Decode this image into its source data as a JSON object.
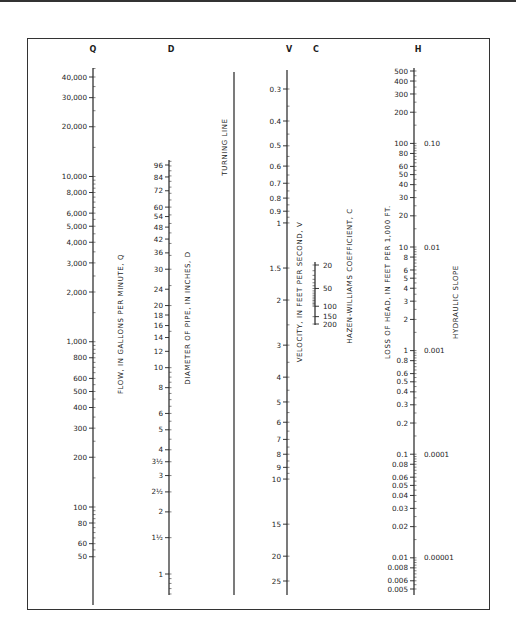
{
  "chart_data": {
    "type": "nomograph",
    "title": "",
    "columns": [
      {
        "key": "Q",
        "header": "Q",
        "title": "FLOW, IN GALLONS PER MINUTE, Q",
        "scale": "log",
        "range": [
          40,
          50000
        ],
        "labels": [
          "40,000",
          "30,000",
          "20,000",
          "10,000",
          "8,000",
          "6,000",
          "5,000",
          "4,000",
          "3,000",
          "2,000",
          "1,000",
          "800",
          "600",
          "500",
          "400",
          "300",
          "200",
          "100",
          "80",
          "60",
          "50"
        ],
        "values": [
          40000,
          30000,
          20000,
          10000,
          8000,
          6000,
          5000,
          4000,
          3000,
          2000,
          1000,
          800,
          600,
          500,
          400,
          300,
          200,
          100,
          80,
          60,
          50
        ]
      },
      {
        "key": "D",
        "header": "D",
        "title": "DIAMETER OF PIPE, IN INCHES, D",
        "scale": "log",
        "range": [
          0.8,
          100
        ],
        "labels": [
          "96",
          "84",
          "72",
          "60",
          "54",
          "48",
          "42",
          "36",
          "30",
          "24",
          "20",
          "18",
          "16",
          "14",
          "12",
          "10",
          "8",
          "6",
          "5",
          "4",
          "3½",
          "3",
          "2½",
          "2",
          "1½",
          "1"
        ],
        "values": [
          96,
          84,
          72,
          60,
          54,
          48,
          42,
          36,
          30,
          24,
          20,
          18,
          16,
          14,
          12,
          10,
          8,
          6,
          5,
          4,
          3.5,
          3,
          2.5,
          2,
          1.5,
          1
        ]
      },
      {
        "key": "T",
        "header": "",
        "title": "TURNING LINE",
        "scale": "none"
      },
      {
        "key": "V",
        "header": "V",
        "title": "VELOCITY, IN FEET PER SECOND, V",
        "scale": "log",
        "range": [
          0.25,
          27
        ],
        "labels": [
          "0.3",
          "0.4",
          "0.5",
          "0.6",
          "0.7",
          "0.8",
          "0.9",
          "1",
          "1.5",
          "2",
          "3",
          "4",
          "5",
          "6",
          "7",
          "8",
          "9",
          "10",
          "15",
          "20",
          "25"
        ],
        "values": [
          0.3,
          0.4,
          0.5,
          0.6,
          0.7,
          0.8,
          0.9,
          1,
          1.5,
          2,
          3,
          4,
          5,
          6,
          7,
          8,
          9,
          10,
          15,
          20,
          25
        ]
      },
      {
        "key": "C",
        "header": "C",
        "title": "HAZEN-WILLIAMS COEFFICIENT, C",
        "scale": "log",
        "range": [
          20,
          200
        ],
        "labels": [
          "20",
          "50",
          "100",
          "150",
          "200"
        ],
        "values": [
          20,
          50,
          100,
          150,
          200
        ]
      },
      {
        "key": "H",
        "header": "H",
        "title": "LOSS OF HEAD, IN FEET PER 1,000 FT.",
        "scale": "log",
        "range": [
          0.005,
          500
        ],
        "labels": [
          "500",
          "400",
          "300",
          "200",
          "100",
          "80",
          "60",
          "50",
          "40",
          "30",
          "20",
          "10",
          "8",
          "6",
          "5",
          "4",
          "3",
          "2",
          "1",
          "0.8",
          "0.6",
          "0.5",
          "0.4",
          "0.3",
          "0.2",
          "0.1",
          "0.08",
          "0.06",
          "0.05",
          "0.04",
          "0.03",
          "0.02",
          "0.01",
          "0.008",
          "0.006",
          "0.005"
        ],
        "values": [
          500,
          400,
          300,
          200,
          100,
          80,
          60,
          50,
          40,
          30,
          20,
          10,
          8,
          6,
          5,
          4,
          3,
          2,
          1,
          0.8,
          0.6,
          0.5,
          0.4,
          0.3,
          0.2,
          0.1,
          0.08,
          0.06,
          0.05,
          0.04,
          0.03,
          0.02,
          0.01,
          0.008,
          0.006,
          0.005
        ]
      },
      {
        "key": "S",
        "header": "",
        "title": "HYDRAULIC SLOPE",
        "scale": "log",
        "labels": [
          "0.10",
          "0.01",
          "0.001",
          "0.0001",
          "0.00001"
        ],
        "values": [
          0.1,
          0.01,
          0.001,
          0.0001,
          1e-05
        ]
      }
    ],
    "grid": false,
    "legend": null
  },
  "headers": {
    "q": "Q",
    "d": "D",
    "v": "V",
    "c": "C",
    "h": "H"
  },
  "titles": {
    "q": "FLOW, IN GALLONS PER MINUTE, Q",
    "d": "DIAMETER OF PIPE, IN INCHES, D",
    "turning": "TURNING LINE",
    "v": "VELOCITY, IN FEET PER SECOND, V",
    "c": "HAZEN-WILLIAMS COEFFICIENT, C",
    "h": "LOSS OF HEAD, IN FEET PER 1,000 FT.",
    "s": "HYDRAULIC SLOPE"
  }
}
